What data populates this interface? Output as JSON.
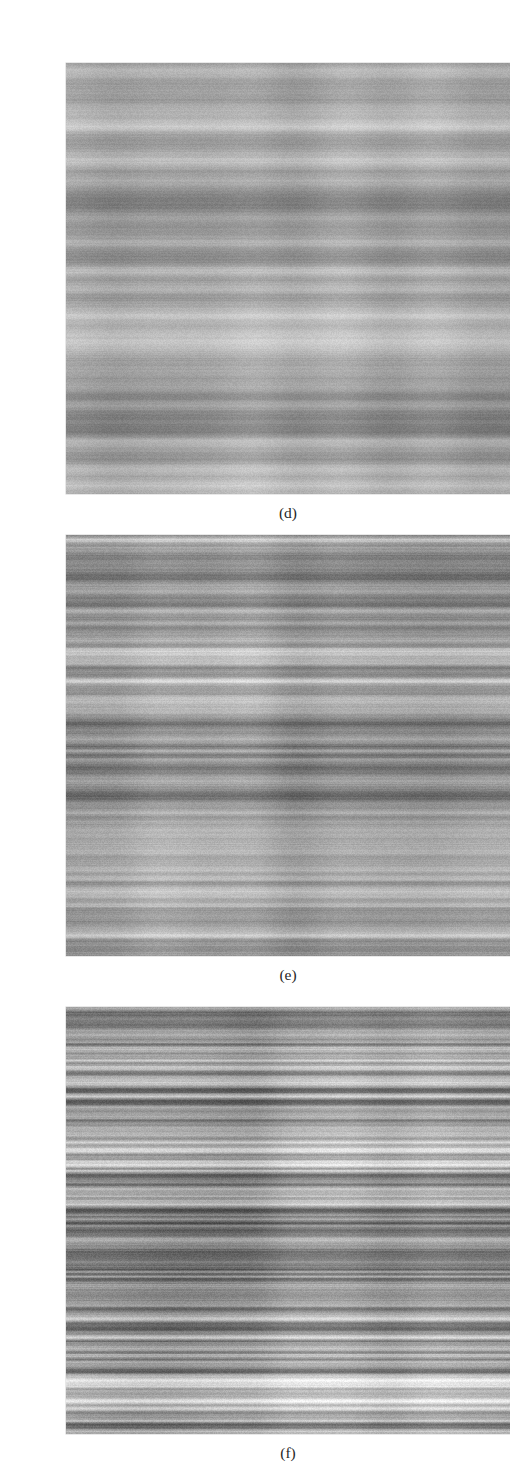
{
  "page": {
    "width": 494,
    "height": 1480,
    "background": "#ffffff",
    "document_type": "scanned-figure-page"
  },
  "cropped_text_above": {
    "visible_fragment": "",
    "note": "bottom descenders only of a caption line cropped at the top edge; text not legible"
  },
  "figure": {
    "panels": [
      {
        "id": "panel-d",
        "caption": "(d)",
        "content_type": "grayscale-texture-image",
        "description": "horizontally striated noise texture, coarse and blurred, low spatial frequency",
        "x": 26,
        "y": 47,
        "width": 444,
        "height": 431,
        "texture": {
          "orientation": "horizontal",
          "band_scale": 9.0,
          "blur": 2.3,
          "contrast": 0.62,
          "grain": 0.3,
          "mean_gray": 168,
          "min_gray": "#6e6e6e",
          "max_gray": "#f2f2f2",
          "seed": 101
        }
      },
      {
        "id": "panel-e",
        "caption": "(e)",
        "content_type": "grayscale-texture-image",
        "description": "horizontally striated noise texture, medium spatial frequency, finer lines than (d)",
        "x": 26,
        "y": 519,
        "width": 444,
        "height": 421,
        "texture": {
          "orientation": "horizontal",
          "band_scale": 4.4,
          "blur": 1.2,
          "contrast": 0.76,
          "grain": 0.34,
          "mean_gray": 162,
          "min_gray": "#5c5c5c",
          "max_gray": "#f6f6f6",
          "seed": 202
        }
      },
      {
        "id": "panel-f",
        "caption": "(f)",
        "content_type": "grayscale-texture-image",
        "description": "horizontally striated noise texture, sharp high-contrast fine lines, high spatial frequency",
        "x": 26,
        "y": 991,
        "width": 444,
        "height": 427,
        "texture": {
          "orientation": "horizontal",
          "band_scale": 2.3,
          "blur": 0.55,
          "contrast": 0.92,
          "grain": 0.38,
          "mean_gray": 155,
          "min_gray": "#4a4a4a",
          "max_gray": "#fbfbfb",
          "seed": 303
        }
      }
    ]
  }
}
